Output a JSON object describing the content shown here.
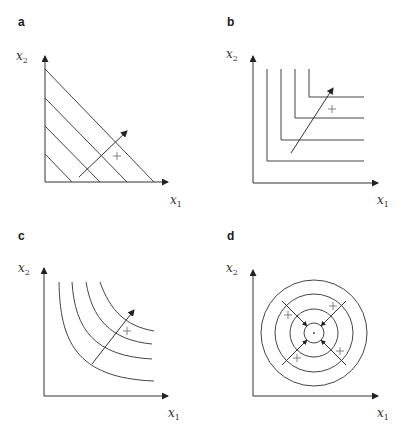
{
  "figure": {
    "panels": [
      {
        "id": "a",
        "label": "a",
        "kind": "linear-indifference-lines",
        "x_label": "x",
        "x_sub": "1",
        "y_label": "x",
        "y_sub": "2",
        "n_curves": 4,
        "plus_markers": 1,
        "gradient_arrows": 1
      },
      {
        "id": "b",
        "label": "b",
        "kind": "leontief-l-shaped-curves",
        "x_label": "x",
        "x_sub": "1",
        "y_label": "x",
        "y_sub": "2",
        "n_curves": 4,
        "plus_markers": 1,
        "gradient_arrows": 1
      },
      {
        "id": "c",
        "label": "c",
        "kind": "convex-indifference-curves",
        "x_label": "x",
        "x_sub": "1",
        "y_label": "x",
        "y_sub": "2",
        "n_curves": 4,
        "plus_markers": 1,
        "gradient_arrows": 1
      },
      {
        "id": "d",
        "label": "d",
        "kind": "concentric-circles-bliss-point",
        "x_label": "x",
        "x_sub": "1",
        "y_label": "x",
        "y_sub": "2",
        "n_curves": 4,
        "plus_markers": 4,
        "gradient_arrows": 4
      }
    ]
  },
  "colors": {
    "line": "#444444",
    "axis": "#333333",
    "marker": "#666666",
    "background": "#ffffff"
  }
}
